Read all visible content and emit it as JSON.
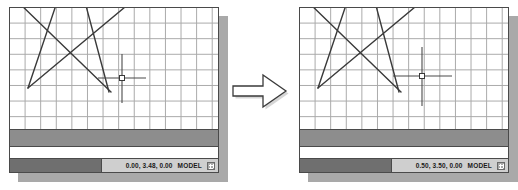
{
  "figure": {
    "type": "before-after-comparison",
    "transition_icon": "right-block-arrow"
  },
  "colors": {
    "window_border": "#4a4a4a",
    "grid_line": "#9a9a9a",
    "geometry_line": "#3a3a3a",
    "command_band": "#8d8d8d",
    "status_left": "#6f6f6f",
    "status_right": "#cfcfcf",
    "shadow": "#a9a9a9",
    "canvas": "#ffffff"
  },
  "panels": [
    {
      "id": "before",
      "name": "cad-window-before",
      "status": {
        "coordinates": "0.00, 3.48, 0.00",
        "space_mode": "MODEL",
        "grid_toggle_icon": "grid-icon"
      },
      "crosshair": {
        "x": 112,
        "y": 70,
        "h_start": 88,
        "h_end": 136,
        "v_start": 46,
        "v_end": 95,
        "pickbox_size": 5
      },
      "geometry": {
        "type": "line-segments",
        "lines": [
          {
            "x1": 8,
            "y1": -6,
            "x2": 101,
            "y2": 84
          },
          {
            "x1": 47,
            "y1": -6,
            "x2": 18,
            "y2": 80
          },
          {
            "x1": 75,
            "y1": -6,
            "x2": 99,
            "y2": 84
          },
          {
            "x1": 18,
            "y1": 80,
            "x2": 121,
            "y2": -6
          }
        ]
      }
    },
    {
      "id": "after",
      "name": "cad-window-after",
      "status": {
        "coordinates": "0.50, 3.50, 0.00",
        "space_mode": "MODEL",
        "grid_toggle_icon": "grid-icon"
      },
      "crosshair": {
        "x": 122,
        "y": 68,
        "h_start": 93,
        "h_end": 152,
        "v_start": 39,
        "v_end": 98,
        "pickbox_size": 5
      },
      "geometry": {
        "type": "line-segments",
        "lines": [
          {
            "x1": 8,
            "y1": -6,
            "x2": 101,
            "y2": 84
          },
          {
            "x1": 47,
            "y1": -6,
            "x2": 18,
            "y2": 80
          },
          {
            "x1": 75,
            "y1": -6,
            "x2": 99,
            "y2": 84
          },
          {
            "x1": 18,
            "y1": 80,
            "x2": 121,
            "y2": -6
          }
        ]
      }
    }
  ]
}
